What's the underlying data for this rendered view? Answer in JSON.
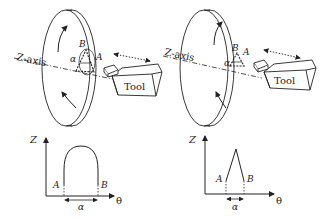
{
  "left_panel": {
    "axis_label": "Z-axis",
    "tool_label": "Tool",
    "point_a": "A",
    "point_b": "B",
    "angle": "α",
    "graph": {
      "y_label": "Z",
      "x_label": "θ",
      "point_a": "A",
      "point_b": "B",
      "span_label": "α",
      "profile": "rounded arch"
    }
  },
  "right_panel": {
    "axis_label": "Z-axis",
    "tool_label": "Tool",
    "point_a": "A",
    "point_b": "B",
    "angle": "α",
    "graph": {
      "y_label": "Z",
      "x_label": "θ",
      "point_a": "A",
      "point_b": "B",
      "span_label": "α",
      "profile": "sharp peak"
    }
  },
  "colors": {
    "stroke": "#222222",
    "background": "#ffffff"
  }
}
